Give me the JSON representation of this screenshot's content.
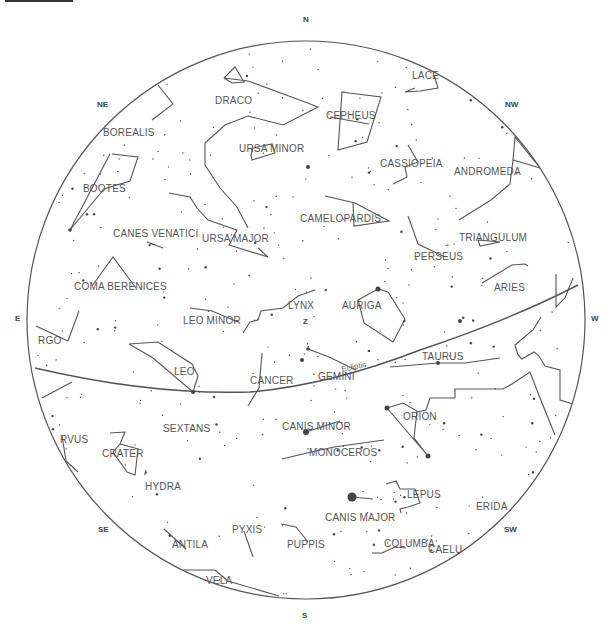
{
  "directions": [
    {
      "id": "N",
      "label": "N"
    },
    {
      "id": "NE",
      "label": "NE"
    },
    {
      "id": "NW",
      "label": "NW"
    },
    {
      "id": "E",
      "label": "E"
    },
    {
      "id": "W",
      "label": "W"
    },
    {
      "id": "SE",
      "label": "SE"
    },
    {
      "id": "SW",
      "label": "SW"
    },
    {
      "id": "S",
      "label": "S"
    }
  ],
  "zenith_label": "Z",
  "ecliptic_label": "Ecliptic",
  "constellations": [
    "LACE",
    "DRACO",
    "CEPHEUS",
    "BOREALIS",
    "URSA MINOR",
    "CASSIOPEIA",
    "ANDROMEDA",
    "BOOTES",
    "CAMELOPARDIS",
    "CANES VENATICI",
    "URSA MAJOR",
    "TRIANGULUM",
    "PERSEUS",
    "COMA BERENICES",
    "ARIES",
    "LYNX",
    "AURIGA",
    "LEO MINOR",
    "RGO",
    "TAURUS",
    "LEO",
    "CANCER",
    "GEMINI",
    "ORION",
    "SEXTANS",
    "CANIS MINOR",
    "CRATER",
    "RVUS",
    "MONOCEROS",
    "HYDRA",
    "LEPUS",
    "CANIS MAJOR",
    "ERIDA",
    "ANTILA",
    "PYXIS",
    "PUPPIS",
    "COLUMBA",
    "CAELU",
    "VELA"
  ]
}
